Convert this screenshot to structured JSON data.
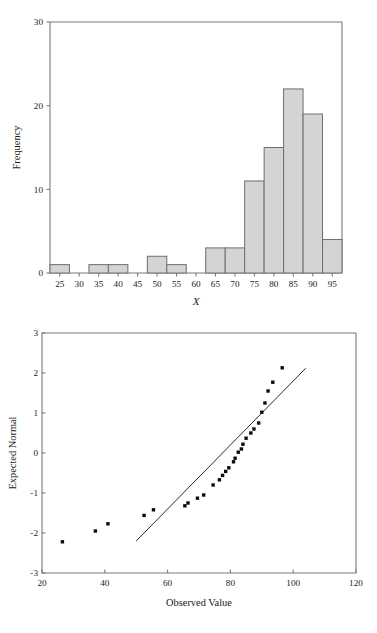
{
  "chart_data": [
    {
      "type": "bar",
      "title": "",
      "xlabel": "X",
      "ylabel": "Frequency",
      "categories": [
        25,
        30,
        35,
        40,
        45,
        50,
        55,
        60,
        65,
        70,
        75,
        80,
        85,
        90,
        95
      ],
      "values": [
        1,
        0,
        1,
        1,
        0,
        2,
        1,
        0,
        3,
        3,
        11,
        15,
        22,
        19,
        4
      ],
      "xticks": [
        25,
        30,
        35,
        40,
        45,
        50,
        55,
        60,
        65,
        70,
        75,
        80,
        85,
        90,
        95
      ],
      "xtick_labels": [
        "25",
        "30",
        "35",
        "40",
        "45",
        "50",
        "55",
        "60",
        "65",
        "70",
        "75",
        "80",
        "85",
        "90",
        "95"
      ],
      "yticks": [
        0,
        10,
        20,
        30
      ],
      "ytick_labels": [
        "0",
        "10",
        "20",
        "30"
      ],
      "ylim": [
        0,
        30
      ],
      "xlim": [
        22.5,
        97.5
      ],
      "bin_width": 5,
      "grid": false,
      "legend": "none",
      "bar_fill_color": "#d4d4d4",
      "bar_edge_color": "#6e6e6e",
      "frame_color": "#7b7b7b"
    },
    {
      "type": "scatter",
      "title": "",
      "xlabel": "Observed Value",
      "ylabel": "Expected Normal",
      "xticks": [
        20,
        40,
        60,
        80,
        100,
        120
      ],
      "xtick_labels": [
        "20",
        "40",
        "60",
        "80",
        "100",
        "120"
      ],
      "yticks": [
        -3,
        -2,
        -1,
        0,
        1,
        2,
        3
      ],
      "ytick_labels": [
        "-3",
        "-2",
        "-1",
        "0",
        "1",
        "2",
        "3"
      ],
      "xlim": [
        20,
        120
      ],
      "ylim": [
        -3,
        3
      ],
      "grid": false,
      "legend": "none",
      "point_color": "#0d0d0d",
      "line_color": "#2b2b2b",
      "frame_color": "#7b7b7b",
      "x": [
        26.5,
        37.0,
        41.0,
        52.5,
        55.5,
        65.5,
        66.5,
        69.5,
        71.5,
        74.5,
        76.5,
        77.5,
        78.5,
        79.5,
        81.0,
        81.5,
        82.5,
        83.5,
        84.0,
        85.0,
        86.5,
        87.5,
        89.0,
        90.0,
        91.0,
        92.0,
        93.5,
        96.5
      ],
      "y": [
        -2.22,
        -1.95,
        -1.77,
        -1.56,
        -1.42,
        -1.32,
        -1.25,
        -1.13,
        -1.05,
        -0.8,
        -0.67,
        -0.56,
        -0.46,
        -0.37,
        -0.22,
        -0.13,
        0.02,
        0.1,
        0.22,
        0.37,
        0.5,
        0.6,
        0.75,
        1.02,
        1.25,
        1.55,
        1.77,
        2.13
      ],
      "reference_line": {
        "x1": 50.0,
        "y1": -2.2,
        "x2": 104.0,
        "y2": 2.12
      }
    }
  ],
  "histogram": {
    "ylabel": "Frequency",
    "xlabel": "X"
  },
  "qqplot": {
    "ylabel": "Expected Normal",
    "xlabel": "Observed Value"
  }
}
